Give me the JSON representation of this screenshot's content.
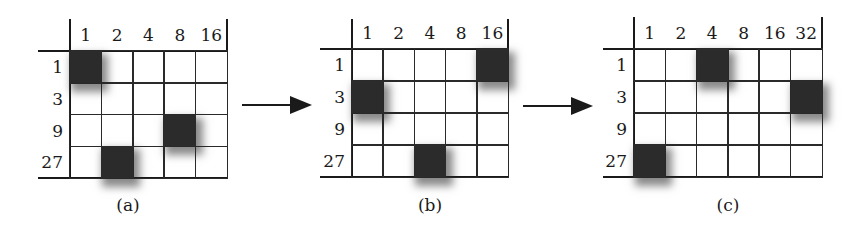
{
  "figure": {
    "panels": [
      {
        "caption": "(a)",
        "col_headers": [
          "1",
          "2",
          "4",
          "8",
          "16"
        ],
        "row_headers": [
          "1",
          "3",
          "9",
          "27"
        ],
        "filled_cells": [
          [
            0,
            0
          ],
          [
            2,
            3
          ],
          [
            3,
            1
          ]
        ]
      },
      {
        "caption": "(b)",
        "col_headers": [
          "1",
          "2",
          "4",
          "8",
          "16"
        ],
        "row_headers": [
          "1",
          "3",
          "9",
          "27"
        ],
        "filled_cells": [
          [
            0,
            4
          ],
          [
            1,
            0
          ],
          [
            3,
            2
          ]
        ]
      },
      {
        "caption": "(c)",
        "col_headers": [
          "1",
          "2",
          "4",
          "8",
          "16",
          "32"
        ],
        "row_headers": [
          "1",
          "3",
          "9",
          "27"
        ],
        "filled_cells": [
          [
            0,
            2
          ],
          [
            1,
            5
          ],
          [
            3,
            0
          ]
        ]
      }
    ],
    "arrows": [
      "a-to-b",
      "b-to-c"
    ],
    "colors": {
      "line": "#1a1a1a",
      "fill": "#2b2b2b",
      "background": "#ffffff"
    }
  }
}
